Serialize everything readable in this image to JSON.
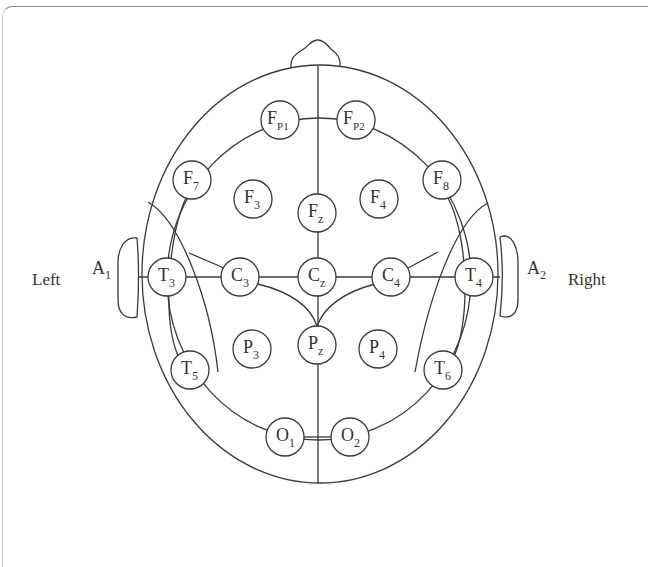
{
  "diagram": {
    "side_labels": {
      "left": "Left",
      "right": "Right"
    },
    "ears": [
      {
        "id": "A1",
        "main": "A",
        "sub": "1"
      },
      {
        "id": "A2",
        "main": "A",
        "sub": "2"
      }
    ],
    "electrodes": [
      {
        "id": "Fp1",
        "main": "F",
        "sub": "P1",
        "x": 280,
        "y": 120
      },
      {
        "id": "Fp2",
        "main": "F",
        "sub": "P2",
        "x": 356,
        "y": 120
      },
      {
        "id": "F7",
        "main": "F",
        "sub": "7",
        "x": 192,
        "y": 180
      },
      {
        "id": "F3",
        "main": "F",
        "sub": "3",
        "x": 253,
        "y": 199
      },
      {
        "id": "Fz",
        "main": "F",
        "sub": "z",
        "x": 317,
        "y": 213
      },
      {
        "id": "F4",
        "main": "F",
        "sub": "4",
        "x": 379,
        "y": 199
      },
      {
        "id": "F8",
        "main": "F",
        "sub": "8",
        "x": 442,
        "y": 180
      },
      {
        "id": "T3",
        "main": "T",
        "sub": "3",
        "x": 167,
        "y": 277
      },
      {
        "id": "C3",
        "main": "C",
        "sub": "3",
        "x": 240,
        "y": 277
      },
      {
        "id": "Cz",
        "main": "C",
        "sub": "z",
        "x": 317,
        "y": 277
      },
      {
        "id": "C4",
        "main": "C",
        "sub": "4",
        "x": 391,
        "y": 277
      },
      {
        "id": "T4",
        "main": "T",
        "sub": "4",
        "x": 474,
        "y": 277
      },
      {
        "id": "P3",
        "main": "P",
        "sub": "3",
        "x": 252,
        "y": 349
      },
      {
        "id": "Pz",
        "main": "P",
        "sub": "z",
        "x": 317,
        "y": 345
      },
      {
        "id": "P4",
        "main": "P",
        "sub": "4",
        "x": 378,
        "y": 349
      },
      {
        "id": "T5",
        "main": "T",
        "sub": "5",
        "x": 190,
        "y": 370
      },
      {
        "id": "T6",
        "main": "T",
        "sub": "6",
        "x": 443,
        "y": 370
      },
      {
        "id": "O1",
        "main": "O",
        "sub": "1",
        "x": 285,
        "y": 437
      },
      {
        "id": "O2",
        "main": "O",
        "sub": "2",
        "x": 350,
        "y": 437
      }
    ],
    "colors": {
      "stroke": "#3a3a3a",
      "text": "#333333",
      "background": "#ffffff"
    }
  }
}
